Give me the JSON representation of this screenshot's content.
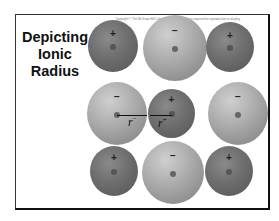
{
  "slide": {
    "copyright": "Copyright © The McGraw-Hill Companies, Inc. Permission required for reproduction or display.",
    "title_lines": [
      "Depicting",
      "Ionic",
      "Radius"
    ]
  },
  "lattice": {
    "description": "3x3 alternating lattice of cations (small, dark) and anions (large, light)",
    "ions": [
      {
        "row": 0,
        "col": 0,
        "type": "cation",
        "charge": "+"
      },
      {
        "row": 0,
        "col": 1,
        "type": "anion",
        "charge": "−"
      },
      {
        "row": 0,
        "col": 2,
        "type": "cation",
        "charge": "+"
      },
      {
        "row": 1,
        "col": 0,
        "type": "anion",
        "charge": "−"
      },
      {
        "row": 1,
        "col": 1,
        "type": "cation",
        "charge": "+"
      },
      {
        "row": 1,
        "col": 2,
        "type": "anion",
        "charge": "−"
      },
      {
        "row": 2,
        "col": 0,
        "type": "cation",
        "charge": "+"
      },
      {
        "row": 2,
        "col": 1,
        "type": "anion",
        "charge": "−"
      },
      {
        "row": 2,
        "col": 2,
        "type": "cation",
        "charge": "+"
      }
    ],
    "labels": {
      "anion_radius": "r",
      "anion_radius_sup": "−",
      "cation_radius": "r",
      "cation_radius_sup": "+"
    },
    "colors": {
      "cation": "#6e6e6e",
      "anion": "#aaaaaa",
      "frame": "#222222"
    }
  }
}
